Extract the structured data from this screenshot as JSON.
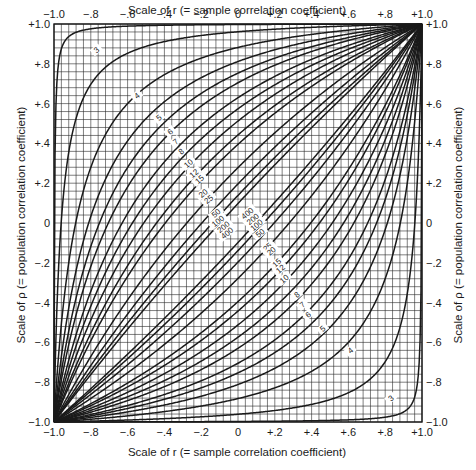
{
  "chart_data": {
    "type": "line",
    "title": "",
    "xlabel": "Scale of r (= sample correlation coefficient)",
    "ylabel": "Scale of ρ (= population correlation coefficient)",
    "xlim": [
      -1.0,
      1.0
    ],
    "ylim": [
      -1.0,
      1.0
    ],
    "grid": true,
    "grid_step": 0.04,
    "x_ticks": [
      "−1.0",
      "−.8",
      "−.6",
      "−.4",
      "−.2",
      "0",
      "+.2",
      "+.4",
      "+.6",
      "+.8",
      "+1.0"
    ],
    "y_ticks": [
      "+1.0",
      "+.8",
      "+.6",
      "+.4",
      "+.2",
      "0",
      "−.2",
      "−.4",
      "−.6",
      "−.8",
      "−1.0"
    ],
    "tick_values": [
      -1.0,
      -0.8,
      -0.6,
      -0.4,
      -0.2,
      0,
      0.2,
      0.4,
      0.6,
      0.8,
      1.0
    ],
    "legend_position": "inline curve labels",
    "series": [
      {
        "name": "3",
        "n": 3
      },
      {
        "name": "4",
        "n": 4
      },
      {
        "name": "5",
        "n": 5
      },
      {
        "name": "6",
        "n": 6
      },
      {
        "name": "7",
        "n": 7
      },
      {
        "name": "8",
        "n": 8
      },
      {
        "name": "10",
        "n": 10
      },
      {
        "name": "12",
        "n": 12
      },
      {
        "name": "15",
        "n": 15
      },
      {
        "name": "20",
        "n": 20
      },
      {
        "name": "25",
        "n": 25
      },
      {
        "name": "50",
        "n": 50
      },
      {
        "name": "100",
        "n": 100
      },
      {
        "name": "200",
        "n": 200
      },
      {
        "name": "400",
        "n": 400
      }
    ],
    "sample_points": {
      "description": "Approximate confidence belt values read at r = 0 (upper / lower rho)",
      "r0_upper": {
        "3": 0.997,
        "4": 0.95,
        "5": 0.88,
        "6": 0.81,
        "7": 0.75,
        "8": 0.71,
        "10": 0.63,
        "12": 0.58,
        "15": 0.51,
        "20": 0.44,
        "25": 0.39,
        "50": 0.28,
        "100": 0.2,
        "200": 0.14,
        "400": 0.1
      },
      "r0_lower": {
        "3": -0.997,
        "4": -0.95,
        "5": -0.88,
        "6": -0.81,
        "7": -0.75,
        "8": -0.71,
        "10": -0.63,
        "12": -0.58,
        "15": -0.51,
        "20": -0.44,
        "25": -0.39,
        "50": -0.28,
        "100": -0.2,
        "200": -0.14,
        "400": -0.1
      }
    },
    "upper_label_positions": [
      {
        "label": "3",
        "r": -0.77,
        "rho": 0.87
      },
      {
        "label": "4",
        "r": -0.55,
        "rho": 0.64
      },
      {
        "label": "5",
        "r": -0.43,
        "rho": 0.53
      },
      {
        "label": "6",
        "r": -0.37,
        "rho": 0.46
      },
      {
        "label": "7",
        "r": -0.34,
        "rho": 0.41
      },
      {
        "label": "8",
        "r": -0.31,
        "rho": 0.36
      },
      {
        "label": "10",
        "r": -0.27,
        "rho": 0.3
      },
      {
        "label": "12",
        "r": -0.24,
        "rho": 0.25
      },
      {
        "label": "15",
        "r": -0.21,
        "rho": 0.22
      },
      {
        "label": "20",
        "r": -0.19,
        "rho": 0.15
      },
      {
        "label": "25",
        "r": -0.16,
        "rho": 0.12
      },
      {
        "label": "50",
        "r": -0.12,
        "rho": 0.05
      },
      {
        "label": "100",
        "r": -0.11,
        "rho": 0.01
      },
      {
        "label": "200",
        "r": -0.08,
        "rho": -0.02
      },
      {
        "label": "400",
        "r": -0.06,
        "rho": -0.05
      }
    ],
    "lower_label_positions": [
      {
        "label": "400",
        "r": 0.05,
        "rho": 0.05
      },
      {
        "label": "200",
        "r": 0.08,
        "rho": 0.02
      },
      {
        "label": "100",
        "r": 0.1,
        "rho": -0.01
      },
      {
        "label": "50",
        "r": 0.12,
        "rho": -0.05
      },
      {
        "label": "25",
        "r": 0.16,
        "rho": -0.12
      },
      {
        "label": "20",
        "r": 0.18,
        "rho": -0.14
      },
      {
        "label": "15",
        "r": 0.21,
        "rho": -0.2
      },
      {
        "label": "12",
        "r": 0.23,
        "rho": -0.23
      },
      {
        "label": "10",
        "r": 0.25,
        "rho": -0.28
      },
      {
        "label": "8",
        "r": 0.32,
        "rho": -0.36
      },
      {
        "label": "7",
        "r": 0.35,
        "rho": -0.41
      },
      {
        "label": "6",
        "r": 0.38,
        "rho": -0.46
      },
      {
        "label": "5",
        "r": 0.46,
        "rho": -0.53
      },
      {
        "label": "4",
        "r": 0.61,
        "rho": -0.64
      },
      {
        "label": "3",
        "r": 0.83,
        "rho": -0.88
      }
    ]
  },
  "axes": {
    "top_title": "Scale of r (= sample correlation coefficient)",
    "bottom_title": "Scale of r (= sample correlation coefficient)",
    "left_title": "Scale of ρ (= population correlation coefficient)",
    "right_title": "Scale of ρ (= population correlation coefficient)"
  },
  "colors": {
    "ink": "#1a1a1a",
    "grid": "#2a2a2a",
    "background": "#ffffff"
  }
}
